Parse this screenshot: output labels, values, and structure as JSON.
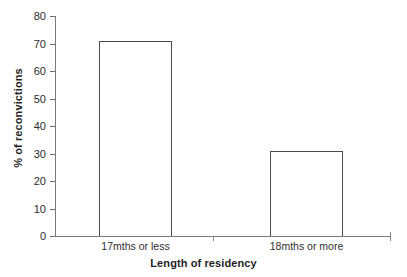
{
  "chart_data": {
    "type": "bar",
    "title": "",
    "subtitle": "",
    "categories": [
      "17mths or less",
      "18mths or more"
    ],
    "values": [
      71,
      31
    ],
    "xlabel": "Length of residency",
    "ylabel": "% of reconvictions",
    "ylim": [
      0,
      80
    ],
    "ytick_step": 10,
    "ytick_labels": [
      "0",
      "10",
      "20",
      "30",
      "40",
      "50",
      "60",
      "70",
      "80"
    ],
    "grid": false,
    "legend": null,
    "bar_fill": "#ffffff",
    "bar_outline": "#4a4a4a",
    "axis_color": "#7a7a7a",
    "background": "#ffffff"
  }
}
